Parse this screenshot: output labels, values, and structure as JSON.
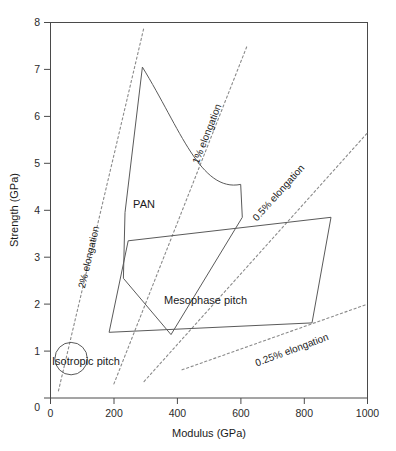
{
  "chart_data": {
    "type": "scatter",
    "title": "",
    "xlabel": "Modulus (GPa)",
    "ylabel": "Strength (GPa)",
    "xlim": [
      0,
      1000
    ],
    "ylim": [
      0,
      8
    ],
    "xticks": [
      0,
      200,
      400,
      600,
      800,
      1000
    ],
    "yticks": [
      0,
      1,
      2,
      3,
      4,
      5,
      6,
      7,
      8
    ],
    "grid": false,
    "legend": "none",
    "regions": [
      {
        "name": "PAN",
        "label": "PAN",
        "label_xy": [
          330,
          4.05
        ],
        "shape": "curved-polygon",
        "vertices": [
          [
            290,
            7.05
          ],
          [
            235,
            3.95
          ],
          [
            230,
            2.55
          ],
          [
            380,
            1.35
          ],
          [
            605,
            3.85
          ],
          [
            600,
            4.55
          ]
        ]
      },
      {
        "name": "Mesophase pitch",
        "label": "Mesophase pitch",
        "label_xy": [
          500,
          2.0
        ],
        "shape": "parallelogram",
        "vertices": [
          [
            245,
            3.35
          ],
          [
            885,
            3.85
          ],
          [
            825,
            1.6
          ],
          [
            185,
            1.4
          ]
        ]
      },
      {
        "name": "Isotropic pitch",
        "label": "Isotropic pitch",
        "label_xy": [
          150,
          0.78
        ],
        "shape": "circle",
        "center": [
          65,
          0.84
        ],
        "radius_x": 40,
        "radius_y": 0.42
      }
    ],
    "iso_strain_lines": [
      {
        "name": "2% elongation",
        "label": "2% elongation",
        "strain_percent": 2,
        "from": [
          25,
          0.15
        ],
        "to": [
          295,
          7.9
        ]
      },
      {
        "name": "1% elongation",
        "label": "1% elongation",
        "strain_percent": 1,
        "from": [
          200,
          0.3
        ],
        "to": [
          620,
          7.5
        ]
      },
      {
        "name": "0.5% elongation",
        "label": "0.5% elongation",
        "strain_percent": 0.5,
        "from": [
          295,
          0.35
        ],
        "to": [
          1000,
          5.65
        ]
      },
      {
        "name": "0.25% elongation",
        "label": "0.25% elongation",
        "strain_percent": 0.25,
        "from": [
          415,
          0.6
        ],
        "to": [
          1000,
          2.0
        ]
      }
    ]
  },
  "axes": {
    "x": {
      "title": "Modulus (GPa)",
      "tick_labels": [
        "0",
        "200",
        "400",
        "600",
        "800",
        "1000"
      ]
    },
    "y": {
      "title": "Strength (GPa)",
      "tick_labels": [
        "0",
        "1",
        "2",
        "3",
        "4",
        "5",
        "6",
        "7",
        "8"
      ]
    }
  },
  "labels": {
    "pan": "PAN",
    "mesophase": "Mesophase pitch",
    "isotropic": "Isotropic pitch",
    "iso2": "2% elongation",
    "iso1": "1% elongation",
    "iso05": "0.5% elongation",
    "iso025": "0.25% elongation"
  },
  "colors": {
    "background": "#ffffff",
    "frame": "#4a4a4a",
    "region_stroke": "#5a5a5a",
    "iso_stroke": "#8a8a8a",
    "text": "#1a1a1a"
  }
}
